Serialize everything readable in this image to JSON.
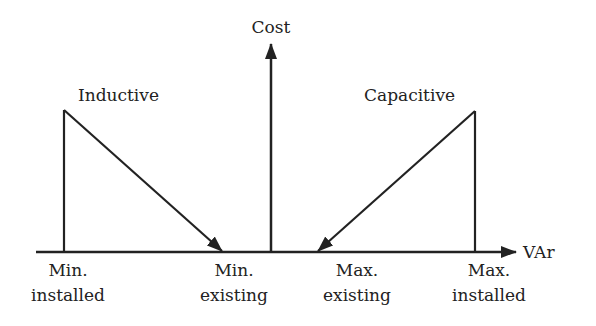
{
  "diagram": {
    "y_axis_label": "Cost",
    "x_axis_label": "VAr",
    "curves": [
      {
        "name": "Inductive",
        "label": "Inductive"
      },
      {
        "name": "Capacitive",
        "label": "Capacitive"
      }
    ],
    "x_ticks": [
      {
        "line1": "Min.",
        "line2": "installed"
      },
      {
        "line1": "Min.",
        "line2": "existing"
      },
      {
        "line1": "Max.",
        "line2": "existing"
      },
      {
        "line1": "Max.",
        "line2": "installed"
      }
    ],
    "colors": {
      "line": "#222222",
      "background": "#ffffff"
    }
  }
}
